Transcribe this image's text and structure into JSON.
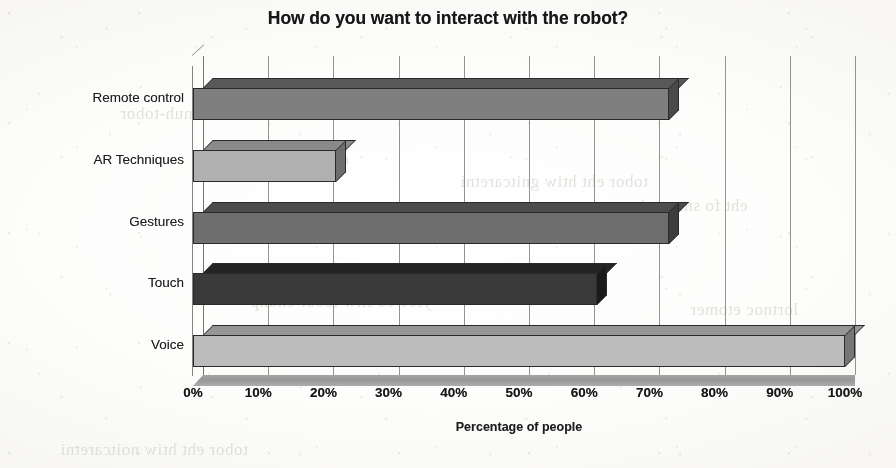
{
  "chart_data": {
    "type": "bar",
    "orientation": "horizontal",
    "title": "How do you want to interact with the robot?",
    "xlabel": "Percentage of people",
    "ylabel": "",
    "categories": [
      "Remote control",
      "AR Techniques",
      "Gestures",
      "Touch",
      "Voice"
    ],
    "values": [
      73,
      22,
      73,
      62,
      100
    ],
    "value_unit": "%",
    "xlim": [
      0,
      100
    ],
    "xticks": [
      0,
      10,
      20,
      30,
      40,
      50,
      60,
      70,
      80,
      90,
      100
    ],
    "xtick_labels": [
      "0%",
      "10%",
      "20%",
      "30%",
      "40%",
      "50%",
      "60%",
      "70%",
      "80%",
      "90%",
      "100%"
    ],
    "grid": "vertical",
    "legend": "none",
    "style_3d": true,
    "bar_colors": [
      "#7f7f7f",
      "#b0b0b0",
      "#6e6e6e",
      "#3a3a3a",
      "#bcbcbc"
    ],
    "bar_top_colors": [
      "#595959",
      "#8a8a8a",
      "#4c4c4c",
      "#242424",
      "#969696"
    ],
    "bar_side_colors": [
      "#4a4a4a",
      "#6e6e6e",
      "#3d3d3d",
      "#1a1a1a",
      "#767676"
    ],
    "series": [
      {
        "name": "Percentage of people",
        "values": [
          73,
          22,
          73,
          62,
          100
        ]
      }
    ]
  },
  "axis": {
    "x_title": "Percentage of people",
    "grid_color": "#7d7b78",
    "axis_color": "#85837f",
    "floor_color": "#9d9d9d"
  },
  "background": {
    "ghost_text": [
      "snoitcaretni namuh-tobor",
      "dna secafretni resu",
      "tobor eht htiw gnitcaretni",
      "eht fo smret ni",
      "yrev eb lliw tobor enohp",
      "lortnoc etomer",
      "tobor eht htiw noitcaretni"
    ]
  }
}
